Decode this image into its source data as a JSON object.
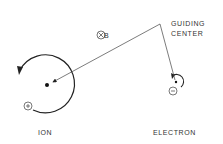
{
  "labels": {
    "guiding_center_line1": "GUIDING",
    "guiding_center_line2": "CENTER",
    "field": "B",
    "ion": "ION",
    "electron": "ELECTRON"
  },
  "symbols": {
    "field_direction": "into-page (⊗)",
    "ion_charge": "+",
    "electron_charge": "−"
  },
  "colors": {
    "ink": "#222222",
    "background": "#ffffff"
  }
}
